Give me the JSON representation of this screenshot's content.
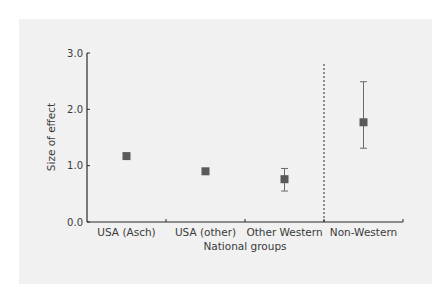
{
  "chart_data": {
    "type": "scatter",
    "subtype": "point-estimate-with-error-bars",
    "title": "",
    "xlabel": "National groups",
    "ylabel": "Size of effect",
    "ylim": [
      0.0,
      3.0
    ],
    "yticks": [
      "0.0",
      "1.0",
      "2.0",
      "3.0"
    ],
    "grid": false,
    "legend": null,
    "categories": [
      "USA (Asch)",
      "USA (other)",
      "Other Western",
      "Non-Western"
    ],
    "values": [
      1.17,
      0.9,
      0.76,
      1.77
    ],
    "error_bars": [
      null,
      null,
      {
        "low": 0.55,
        "high": 0.95
      },
      {
        "low": 1.31,
        "high": 2.49
      }
    ],
    "annotations": [
      {
        "type": "dashed-vertical-divider",
        "between": [
          "Other Western",
          "Non-Western"
        ]
      }
    ],
    "colors": {
      "panel_background": "#f1f1f1",
      "marker": "#5a5a5a",
      "axis": "#2b2b2b",
      "text": "#3a3a3a"
    }
  }
}
